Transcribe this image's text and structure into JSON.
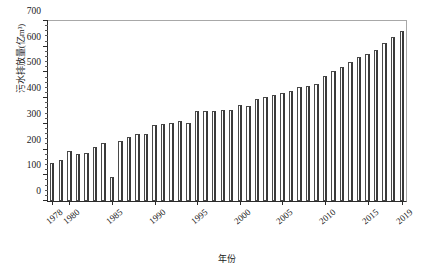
{
  "chart_data": {
    "type": "bar",
    "title": "",
    "xlabel": "年份",
    "ylabel": "污水排放量(亿m³)",
    "ylim": [
      0,
      700
    ],
    "ytick_step": 100,
    "yminor_step": 20,
    "grid": false,
    "legend": null,
    "categories": [
      "1978",
      "1979",
      "1980",
      "1981",
      "1982",
      "1983",
      "1984",
      "1985",
      "1986",
      "1987",
      "1988",
      "1989",
      "1990",
      "1991",
      "1992",
      "1993",
      "1994",
      "1995",
      "1996",
      "1997",
      "1998",
      "1999",
      "2000",
      "2001",
      "2002",
      "2003",
      "2004",
      "2005",
      "2006",
      "2007",
      "2008",
      "2009",
      "2010",
      "2011",
      "2012",
      "2013",
      "2014",
      "2015",
      "2016",
      "2017",
      "2018",
      "2019"
    ],
    "values": [
      149,
      161,
      195,
      183,
      186,
      210,
      226,
      95,
      232,
      250,
      262,
      261,
      295,
      300,
      302,
      312,
      305,
      350,
      352,
      351,
      355,
      355,
      375,
      370,
      395,
      406,
      413,
      419,
      428,
      442,
      447,
      455,
      485,
      504,
      523,
      540,
      560,
      570,
      589,
      614,
      638,
      660
    ],
    "xtick_labels": [
      "1978",
      "1980",
      "1985",
      "1990",
      "1995",
      "2000",
      "2005",
      "2010",
      "2015",
      "2019"
    ],
    "ytick_labels": [
      "0",
      "100",
      "200",
      "300",
      "400",
      "500",
      "600",
      "700"
    ],
    "bar_fill_color": "#ffffff",
    "bar_edge_color": "#4a4a4a",
    "axis_color": "#2b2b2b"
  }
}
